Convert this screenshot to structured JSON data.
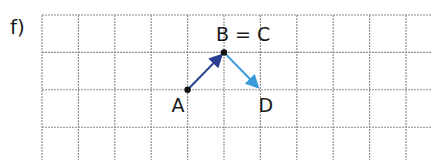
{
  "exercise_label": "f)",
  "grid": {
    "columns": 10,
    "rows": 3.9,
    "line_color": "#8a8a8a"
  },
  "points": [
    {
      "id": "A",
      "label": "A",
      "gx": 4,
      "gy": 2
    },
    {
      "id": "B",
      "label": "B = C",
      "gx": 5,
      "gy": 1
    },
    {
      "id": "D",
      "label": "D",
      "gx": 6,
      "gy": 2
    }
  ],
  "vectors": [
    {
      "from": "A",
      "to": "B",
      "color": "#2a3f8f"
    },
    {
      "from": "B",
      "to": "D",
      "color": "#3b9ad9"
    }
  ],
  "colors": {
    "point": "#111111",
    "text": "#1a1a1a"
  }
}
